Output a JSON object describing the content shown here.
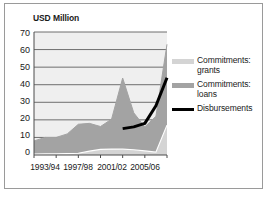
{
  "figure": {
    "title": "USD Million",
    "background_color": "#ffffff",
    "frame_color": "#9a9a9a"
  },
  "chart_data": {
    "type": "area",
    "title": "USD Million",
    "xlabel": "",
    "ylabel": "USD Million",
    "ylim": [
      0,
      70
    ],
    "yticks": [
      0,
      10,
      20,
      30,
      40,
      50,
      60,
      70
    ],
    "ytick_labels": [
      "0",
      "10",
      "20",
      "30",
      "40",
      "50",
      "60",
      "70"
    ],
    "grid": true,
    "grid_axis": "y",
    "legend_position": "right",
    "stacked": true,
    "categories": [
      "1993/94",
      "1994/95",
      "1995/96",
      "1996/97",
      "1997/98",
      "1998/99",
      "1999/00",
      "2000/01",
      "2001/02",
      "2002/03",
      "2003/04",
      "2004/05",
      "2005/06"
    ],
    "xtick_labels": [
      "1993/94",
      "1997/98",
      "2001/02",
      "2005/06"
    ],
    "xtick_category_index": [
      0,
      4,
      8,
      12
    ],
    "series": [
      {
        "name": "Commitments: grants",
        "type": "area",
        "color": "#d4d4d4",
        "values": [
          0.5,
          0.6,
          0.7,
          0.8,
          1.0,
          2.2,
          3.2,
          3.4,
          3.3,
          3.0,
          2.3,
          1.6,
          17.0
        ]
      },
      {
        "name": "Commitments: loans",
        "type": "area",
        "color": "#a3a3a3",
        "values": [
          7.5,
          9.4,
          9.3,
          11.2,
          16.5,
          15.8,
          13.0,
          17.0,
          40.5,
          21.0,
          13.7,
          20.4,
          46.0
        ]
      },
      {
        "name": "Disbursements",
        "type": "line",
        "color": "#000000",
        "values": [
          null,
          null,
          null,
          null,
          null,
          null,
          null,
          null,
          15.0,
          16.0,
          18.0,
          28.0,
          44.0
        ]
      }
    ],
    "series_totals": [
      8.0,
      10.0,
      10.0,
      12.0,
      17.5,
      18.0,
      16.2,
      20.4,
      43.8,
      24.0,
      16.0,
      22.0,
      63.0
    ]
  },
  "legend": {
    "items": [
      {
        "label_line1": "Commitments:",
        "label_line2": "grants",
        "marker": "swatch",
        "color": "#d4d4d4"
      },
      {
        "label_line1": "Commitments:",
        "label_line2": "loans",
        "marker": "swatch",
        "color": "#a3a3a3"
      },
      {
        "label_line1": "Disbursements",
        "label_line2": "",
        "marker": "line",
        "color": "#000000"
      }
    ]
  },
  "plot": {
    "area_background": "#efefef",
    "gridline_color": "#6e6e6e",
    "axis_color": "#4d4d4d"
  }
}
